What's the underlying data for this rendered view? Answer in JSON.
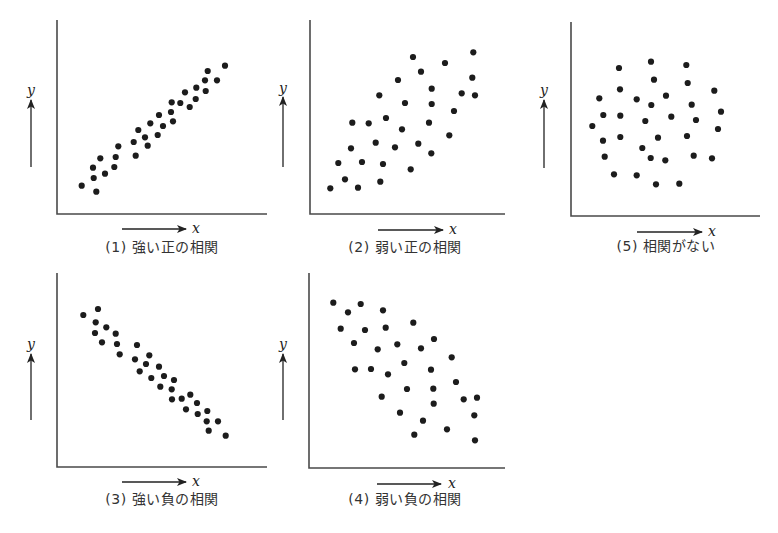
{
  "figure": {
    "width": 778,
    "height": 533,
    "colors": {
      "dot": "#1c1c1c",
      "axis": "#4a4a4a",
      "arrow": "#222222",
      "caption": "#333333",
      "background": "#ffffff"
    }
  },
  "chart_data": [
    {
      "id": "plot1",
      "type": "scatter",
      "title": "(1) 強い正の相関",
      "xlabel": "x",
      "ylabel": "y",
      "grid": false,
      "axes_box": {
        "left": 57,
        "top": 20,
        "right": 267,
        "bottom": 214
      },
      "y_arrow": {
        "x": 31,
        "tip": 100,
        "tail": 167,
        "label_y": 90
      },
      "x_arrow": {
        "y": 229,
        "tail": 122,
        "tip": 186,
        "label_x": 196
      },
      "caption_pos": {
        "x": 162,
        "y": 243
      },
      "points": [
        [
          81.7,
          185.7
        ],
        [
          96.3,
          191.7
        ],
        [
          93.7,
          178
        ],
        [
          93,
          167.7
        ],
        [
          100.3,
          158.3
        ],
        [
          105,
          173.7
        ],
        [
          114.3,
          167
        ],
        [
          115.7,
          157
        ],
        [
          118.3,
          146.3
        ],
        [
          135.7,
          155.7
        ],
        [
          133.7,
          142
        ],
        [
          138.3,
          130
        ],
        [
          145,
          137.3
        ],
        [
          147.7,
          145.7
        ],
        [
          150.3,
          123.3
        ],
        [
          157.7,
          135
        ],
        [
          163,
          126
        ],
        [
          159,
          115
        ],
        [
          171,
          112
        ],
        [
          173,
          121.3
        ],
        [
          171.7,
          102.3
        ],
        [
          180.3,
          103
        ],
        [
          185,
          92.3
        ],
        [
          189.7,
          107
        ],
        [
          195.7,
          99
        ],
        [
          196.3,
          87.7
        ],
        [
          205.7,
          91
        ],
        [
          205,
          80.3
        ],
        [
          207.7,
          71
        ],
        [
          217,
          80.3
        ],
        [
          225,
          65.7
        ]
      ]
    },
    {
      "id": "plot2",
      "type": "scatter",
      "title": "(2) 弱い正の相関",
      "xlabel": "x",
      "ylabel": "y",
      "grid": false,
      "axes_box": {
        "left": 310,
        "top": 20,
        "right": 505,
        "bottom": 214
      },
      "y_arrow": {
        "x": 283,
        "tip": 97,
        "tail": 167,
        "label_y": 88
      },
      "x_arrow": {
        "y": 230,
        "tail": 378,
        "tip": 443,
        "label_x": 453
      },
      "caption_pos": {
        "x": 405,
        "y": 243
      },
      "points": [
        [
          330.3,
          188.3
        ],
        [
          345,
          179.3
        ],
        [
          358,
          187.7
        ],
        [
          338.3,
          163
        ],
        [
          351,
          148.3
        ],
        [
          362,
          162
        ],
        [
          352.3,
          122.7
        ],
        [
          368.7,
          123.3
        ],
        [
          375.7,
          142.7
        ],
        [
          383,
          164
        ],
        [
          380.3,
          181.7
        ],
        [
          379.3,
          95.3
        ],
        [
          386,
          118
        ],
        [
          395,
          147.3
        ],
        [
          402,
          129.3
        ],
        [
          398,
          80
        ],
        [
          405,
          103
        ],
        [
          410.7,
          169.3
        ],
        [
          413,
          57
        ],
        [
          418.3,
          143.7
        ],
        [
          421,
          71.7
        ],
        [
          429,
          122.7
        ],
        [
          431.3,
          153.3
        ],
        [
          431.7,
          88.7
        ],
        [
          431.7,
          104
        ],
        [
          445,
          63
        ],
        [
          449.3,
          135.3
        ],
        [
          454,
          111
        ],
        [
          461.7,
          93.3
        ],
        [
          472.3,
          77.7
        ],
        [
          473.3,
          52.3
        ],
        [
          475,
          95.3
        ]
      ]
    },
    {
      "id": "plot5",
      "type": "scatter",
      "title": "(5) 相関がない",
      "xlabel": "x",
      "ylabel": "y",
      "grid": false,
      "axes_box": {
        "left": 571,
        "top": 22,
        "right": 760,
        "bottom": 216
      },
      "y_arrow": {
        "x": 544,
        "tip": 100,
        "tail": 168,
        "label_y": 90
      },
      "x_arrow": {
        "y": 232,
        "tail": 637,
        "tip": 702,
        "label_x": 712
      },
      "caption_pos": {
        "x": 666,
        "y": 242
      },
      "points": [
        [
          619,
          68
        ],
        [
          651,
          61.7
        ],
        [
          686.3,
          65
        ],
        [
          654,
          79.7
        ],
        [
          687.7,
          83
        ],
        [
          620,
          89.3
        ],
        [
          714.3,
          90.7
        ],
        [
          599.3,
          98.3
        ],
        [
          636.7,
          99.3
        ],
        [
          666,
          95.7
        ],
        [
          651.3,
          105
        ],
        [
          691.7,
          104.7
        ],
        [
          721,
          111.7
        ],
        [
          603.3,
          115
        ],
        [
          620.3,
          115.7
        ],
        [
          645.3,
          121
        ],
        [
          671.3,
          116.7
        ],
        [
          696,
          120
        ],
        [
          592.3,
          126
        ],
        [
          718,
          129
        ],
        [
          603,
          140.7
        ],
        [
          620.3,
          137
        ],
        [
          658,
          137.7
        ],
        [
          687,
          136
        ],
        [
          642.3,
          148
        ],
        [
          604.7,
          156.7
        ],
        [
          650.7,
          158
        ],
        [
          665.3,
          160.3
        ],
        [
          693.7,
          155.7
        ],
        [
          712,
          158.3
        ],
        [
          614,
          174.3
        ],
        [
          636.7,
          175.3
        ],
        [
          656,
          184.3
        ],
        [
          679.3,
          183.7
        ]
      ]
    },
    {
      "id": "plot3",
      "type": "scatter",
      "title": "(3) 強い負の相関",
      "xlabel": "x",
      "ylabel": "y",
      "grid": false,
      "axes_box": {
        "left": 57,
        "top": 273,
        "right": 267,
        "bottom": 467
      },
      "y_arrow": {
        "x": 31,
        "tip": 354,
        "tail": 420,
        "label_y": 344
      },
      "x_arrow": {
        "y": 482,
        "tail": 122,
        "tip": 186,
        "label_x": 196
      },
      "caption_pos": {
        "x": 162,
        "y": 495
      },
      "points": [
        [
          83.3,
          315
        ],
        [
          98,
          309
        ],
        [
          95.7,
          322.3
        ],
        [
          95,
          333
        ],
        [
          106.3,
          327.3
        ],
        [
          102,
          342.3
        ],
        [
          115.7,
          333.7
        ],
        [
          117,
          344
        ],
        [
          119.7,
          354.3
        ],
        [
          137,
          345
        ],
        [
          135,
          359.3
        ],
        [
          149.3,
          355.3
        ],
        [
          146,
          364
        ],
        [
          139.7,
          371.3
        ],
        [
          159,
          366.7
        ],
        [
          151.3,
          378
        ],
        [
          164,
          376
        ],
        [
          174,
          380
        ],
        [
          160.3,
          386.7
        ],
        [
          171.7,
          389.3
        ],
        [
          172,
          399.3
        ],
        [
          181.7,
          398.7
        ],
        [
          190.3,
          394.7
        ],
        [
          186,
          409.3
        ],
        [
          197,
          403
        ],
        [
          197.7,
          414
        ],
        [
          207.3,
          411
        ],
        [
          206.7,
          421.3
        ],
        [
          218,
          421.3
        ],
        [
          208.7,
          430.7
        ],
        [
          225.7,
          435.7
        ]
      ]
    },
    {
      "id": "plot4",
      "type": "scatter",
      "title": "(4) 弱い負の相関",
      "xlabel": "x",
      "ylabel": "y",
      "grid": false,
      "axes_box": {
        "left": 309,
        "top": 273,
        "right": 505,
        "bottom": 468
      },
      "y_arrow": {
        "x": 283,
        "tip": 354,
        "tail": 420,
        "label_y": 344
      },
      "x_arrow": {
        "y": 484,
        "tail": 377,
        "tip": 441,
        "label_x": 452
      },
      "caption_pos": {
        "x": 405,
        "y": 495
      },
      "points": [
        [
          333.3,
          302.7
        ],
        [
          348,
          312.3
        ],
        [
          360.7,
          304
        ],
        [
          383,
          310.3
        ],
        [
          340.7,
          328.7
        ],
        [
          365,
          330
        ],
        [
          385.7,
          327.7
        ],
        [
          413.3,
          322.7
        ],
        [
          354,
          343
        ],
        [
          377.7,
          349.3
        ],
        [
          397.3,
          344.3
        ],
        [
          421,
          348.3
        ],
        [
          434,
          339
        ],
        [
          355,
          369.3
        ],
        [
          371,
          369
        ],
        [
          388,
          374.3
        ],
        [
          404.3,
          363
        ],
        [
          431,
          369.7
        ],
        [
          451.7,
          357.3
        ],
        [
          407,
          389
        ],
        [
          433.3,
          388.7
        ],
        [
          456,
          382
        ],
        [
          381.7,
          396.7
        ],
        [
          433.7,
          403.7
        ],
        [
          463.7,
          399.3
        ],
        [
          477,
          397.7
        ],
        [
          400,
          412.7
        ],
        [
          423,
          420.7
        ],
        [
          474.3,
          415.3
        ],
        [
          414.3,
          434.7
        ],
        [
          447,
          429.3
        ],
        [
          475,
          440.3
        ]
      ]
    }
  ]
}
